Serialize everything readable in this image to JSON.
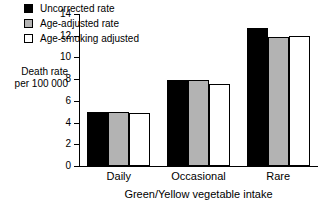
{
  "chart_data": {
    "type": "bar",
    "title": "",
    "subtitle": "",
    "xlabel": "Green/Yellow vegetable intake",
    "ylabel": "Death rate per 100 000",
    "ylabel_line1": "Death rate",
    "ylabel_line2": "per 100 000",
    "categories": [
      "Daily",
      "Occasional",
      "Rare"
    ],
    "series": [
      {
        "name": "Uncorrected rate",
        "color": "#000000",
        "values": [
          5.0,
          7.9,
          12.7
        ]
      },
      {
        "name": "Age-adjusted rate",
        "color": "#b3b3b3",
        "values": [
          5.0,
          7.9,
          11.85
        ]
      },
      {
        "name": "Age-smoking adjusted",
        "color": "#ffffff",
        "values": [
          4.85,
          7.6,
          12.0
        ]
      }
    ],
    "ylim": [
      0,
      14
    ],
    "yticks": [
      0,
      2,
      4,
      6,
      8,
      10,
      12,
      14
    ],
    "ytick_labels": [
      "0",
      "2",
      "4",
      "6",
      "8",
      "10",
      "12",
      "14"
    ],
    "grid": false,
    "legend_position": "top-left-inside",
    "bar_edge_color": "#000000"
  },
  "legend": {
    "entries": [
      {
        "label": "Uncorrected rate",
        "swatch": "black"
      },
      {
        "label": "Age-adjusted rate",
        "swatch": "gray"
      },
      {
        "label": "Age-smoking adjusted",
        "swatch": "white"
      }
    ]
  }
}
